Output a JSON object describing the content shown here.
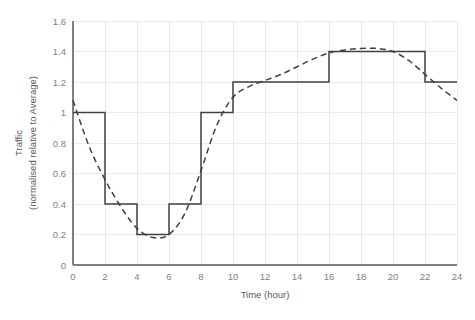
{
  "chart_data": {
    "type": "line",
    "title": "",
    "xlabel": "Time (hour)",
    "ylabel": "Traffic\n(normalised relative to Average)",
    "ylabel_line1": "Traffic",
    "ylabel_line2": "(normalised relative to Average)",
    "xlim": [
      0,
      24
    ],
    "ylim": [
      0,
      1.6
    ],
    "xticks": [
      0,
      2,
      4,
      6,
      8,
      10,
      12,
      14,
      16,
      18,
      20,
      22,
      24
    ],
    "yticks": [
      0,
      0.2,
      0.4,
      0.6,
      0.8,
      1,
      1.2,
      1.4,
      1.6
    ],
    "xtick_labels": [
      "0",
      "2",
      "4",
      "6",
      "8",
      "10",
      "12",
      "14",
      "16",
      "18",
      "20",
      "22",
      "24"
    ],
    "ytick_labels": [
      "0",
      "0.2",
      "0.4",
      "0.6",
      "0.8",
      "1",
      "1.2",
      "1.4",
      "1.6"
    ],
    "grid": true,
    "grid_axis": "both",
    "legend": false,
    "legend_position": "none",
    "series": [
      {
        "name": "Stepped traffic profile",
        "style": "solid",
        "color": "#404040",
        "interpolation": "step",
        "step_intervals": [
          {
            "start_hour": 0,
            "end_hour": 2,
            "value": 1.0
          },
          {
            "start_hour": 2,
            "end_hour": 4,
            "value": 0.4
          },
          {
            "start_hour": 4,
            "end_hour": 6,
            "value": 0.2
          },
          {
            "start_hour": 6,
            "end_hour": 8,
            "value": 0.4
          },
          {
            "start_hour": 8,
            "end_hour": 10,
            "value": 1.0
          },
          {
            "start_hour": 10,
            "end_hour": 16,
            "value": 1.2
          },
          {
            "start_hour": 16,
            "end_hour": 22,
            "value": 1.4
          },
          {
            "start_hour": 22,
            "end_hour": 24,
            "value": 1.2
          }
        ]
      },
      {
        "name": "Smooth traffic profile",
        "style": "dashed",
        "color": "#404040",
        "interpolation": "smooth",
        "x": [
          0,
          1,
          2,
          3,
          4,
          5,
          6,
          7,
          8,
          9,
          10,
          11,
          12,
          13,
          14,
          15,
          16,
          17,
          18,
          19,
          20,
          21,
          22,
          23,
          24
        ],
        "values": [
          1.08,
          0.78,
          0.56,
          0.38,
          0.24,
          0.18,
          0.2,
          0.34,
          0.62,
          0.92,
          1.1,
          1.17,
          1.21,
          1.25,
          1.3,
          1.35,
          1.39,
          1.41,
          1.42,
          1.42,
          1.4,
          1.34,
          1.25,
          1.16,
          1.08
        ]
      }
    ]
  }
}
